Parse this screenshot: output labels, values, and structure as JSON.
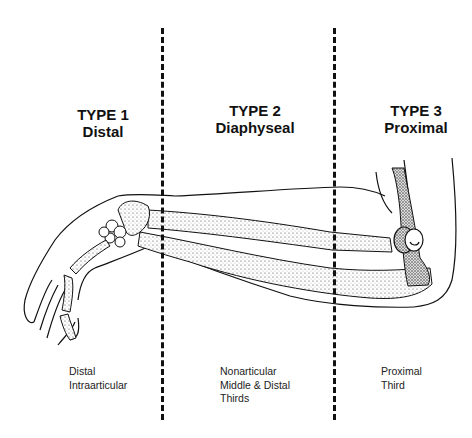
{
  "figure": {
    "zones": [
      {
        "title_line1": "TYPE 1",
        "title_line2": "Distal",
        "desc_lines": [
          "Distal",
          "Intraarticular"
        ]
      },
      {
        "title_line1": "TYPE 2",
        "title_line2": "Diaphyseal",
        "desc_lines": [
          "Nonarticular",
          "Middle & Distal",
          "Thirds"
        ]
      },
      {
        "title_line1": "TYPE 3",
        "title_line2": "Proximal",
        "desc_lines": [
          "Proximal",
          "Third"
        ]
      }
    ],
    "illustration": "forearm-with-radius-and-ulna-bones",
    "divider_style": "dashed"
  }
}
